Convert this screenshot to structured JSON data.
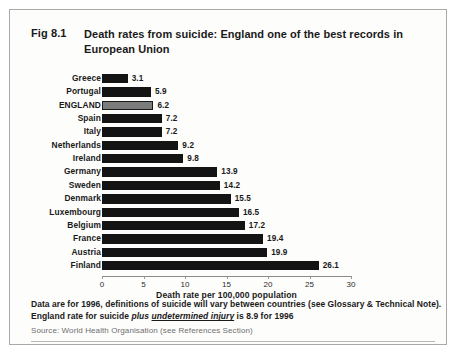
{
  "figure": {
    "number": "Fig 8.1",
    "title": "Death rates from suicide:  England one of the best records in European Union"
  },
  "notes": {
    "line1": "Data are for 1996, definitions of suicide will vary between countries (see Glossary & Technical Note).",
    "line2_part1": "England rate for suicide ",
    "line2_italic": "plus ",
    "line2_italic_underline": "undetermined injury",
    "line2_part2": " is 8.9 for 1996",
    "source": "Source: World Health Organisation (see References Section)"
  },
  "colors": {
    "bar": "#141414",
    "highlight_bar": "#7c7c7c",
    "highlight_border": "#1a1a1a",
    "axis": "#8c8c8c",
    "text": "#1a1a1a",
    "source_text": "#6f6f6f",
    "panel_border": "#a9a9a9",
    "background": "#fdfdfc"
  },
  "chart_data": {
    "type": "bar",
    "orientation": "horizontal",
    "title": "Death rates from suicide:  England one of the best records in European Union",
    "xlabel": "Death rate per 100,000 population",
    "ylabel": "",
    "xlim": [
      0,
      30
    ],
    "xticks": [
      0,
      5,
      10,
      15,
      20,
      25,
      30
    ],
    "xtick_labels": [
      "0",
      "5",
      "10",
      "15",
      "20",
      "25",
      "30"
    ],
    "grid": false,
    "legend": null,
    "highlight_category": "ENGLAND",
    "categories": [
      "Greece",
      "Portugal",
      "ENGLAND",
      "Spain",
      "Italy",
      "Netherlands",
      "Ireland",
      "Germany",
      "Sweden",
      "Denmark",
      "Luxembourg",
      "Belgium",
      "France",
      "Austria",
      "Finland"
    ],
    "values": [
      3.1,
      5.9,
      6.2,
      7.2,
      7.2,
      9.2,
      9.8,
      13.9,
      14.2,
      15.5,
      16.5,
      17.2,
      19.4,
      19.9,
      26.1
    ],
    "value_labels": [
      "3.1",
      "5.9",
      "6.2",
      "7.2",
      "7.2",
      "9.2",
      "9.8",
      "13.9",
      "14.2",
      "15.5",
      "16.5",
      "17.2",
      "19.4",
      "19.9",
      "26.1"
    ]
  }
}
